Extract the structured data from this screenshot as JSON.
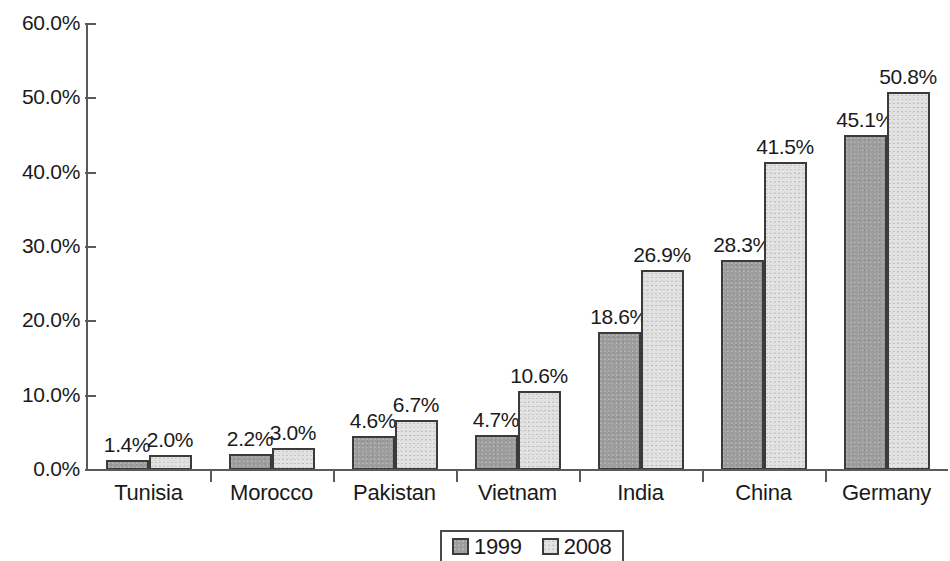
{
  "chart_data": {
    "type": "bar",
    "title": "",
    "subtitle": "",
    "xlabel": "",
    "ylabel": "",
    "categories": [
      "Tunisia",
      "Morocco",
      "Pakistan",
      "Vietnam",
      "India",
      "China",
      "Germany"
    ],
    "series": [
      {
        "name": "1999",
        "color": "#9d9d9d",
        "values": [
          1.4,
          2.2,
          4.6,
          4.7,
          18.6,
          28.3,
          45.1
        ],
        "labels": [
          "1.4%",
          "2.2%",
          "4.6%",
          "4.7%",
          "18.6%",
          "28.3%",
          "45.1%"
        ]
      },
      {
        "name": "2008",
        "color": "#e2e2e2",
        "values": [
          2.0,
          3.0,
          6.7,
          10.6,
          26.9,
          41.5,
          50.8
        ],
        "labels": [
          "2.0%",
          "3.0%",
          "6.7%",
          "10.6%",
          "26.9%",
          "41.5%",
          "50.8%"
        ]
      }
    ],
    "ylim": [
      0,
      60
    ],
    "y_ticks": [
      60,
      50,
      40,
      30,
      20,
      10,
      0
    ],
    "y_tick_labels": [
      "60.0%",
      "50.0%",
      "40.0%",
      "30.0%",
      "20.0%",
      "10.0%",
      "0.0%"
    ],
    "grid": false,
    "legend_position": "bottom",
    "value_labels_shown": true
  },
  "legend": {
    "entries": [
      {
        "label": "1999",
        "swatch": "dark-gray-swatch"
      },
      {
        "label": "2008",
        "swatch": "light-gray-swatch"
      }
    ]
  }
}
